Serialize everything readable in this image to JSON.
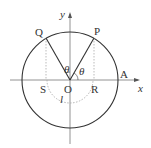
{
  "diagram": {
    "type": "unit-circle-geometry",
    "axes": {
      "x_label": "x",
      "y_label": "y"
    },
    "points": {
      "origin": "O",
      "P": "P",
      "Q": "Q",
      "A": "A",
      "R": "R",
      "S": "S"
    },
    "angle_labels": {
      "theta_right": "θ",
      "theta_left": "θ"
    },
    "arc_label": "l",
    "colors": {
      "stroke": "#333333",
      "dotted": "#999999",
      "background": "#ffffff"
    }
  }
}
